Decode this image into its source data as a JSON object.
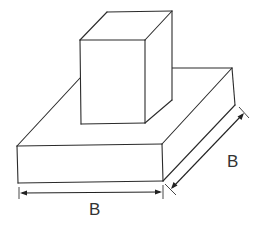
{
  "figure": {
    "elements": {
      "column": "Rectangular column (pedestal) sitting on top of the footing",
      "footing": "Square slab footing"
    },
    "dimensions": {
      "width_label": "B",
      "depth_label": "B"
    }
  },
  "colors": {
    "line": "#2b2b2b",
    "background": "#ffffff"
  }
}
